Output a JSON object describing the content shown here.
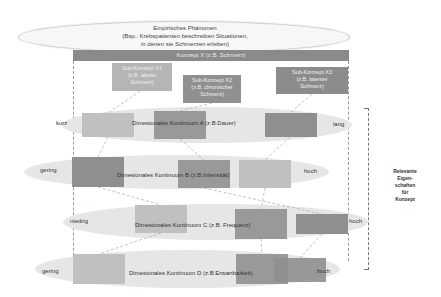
{
  "phenomenon": {
    "title": "Empirisches Phänomen",
    "line2": "(Bsp.: Krebspatienten beschreiben Situationen,",
    "line3": "in denen sie Schmerzen erleben)"
  },
  "concept": {
    "label": "Konzept X (z.B. Schmerz)"
  },
  "sub_concepts": [
    {
      "line1": "Sub-Konzept X1",
      "line2": "(z.B. akuter",
      "line3": "Schmerz)",
      "color": "#b5b5b5"
    },
    {
      "line1": "Sub-Konzept X2",
      "line2": "(z.B. chronischer",
      "line3": "Schmerz)",
      "color": "#909090"
    },
    {
      "line1": "Sub-Konzept X3",
      "line2": "(z.B. latenter",
      "line3": "Schmerz)",
      "color": "#8c8c8c"
    }
  ],
  "continua": [
    {
      "label": "Dimesionales Kontinuum A (z.B.Dauer)",
      "low": "kurz",
      "high": "lang"
    },
    {
      "label": "Dimesionales Kontinuum B (z.B.Intensität)",
      "low": "gering",
      "high": "hoch"
    },
    {
      "label": "Dimesionales Kontinuum C (z.B. Frequenz)",
      "low": "niedrig",
      "high": "hoch"
    },
    {
      "label": "Dimesionales Kontinuum D (z.B.Erwartbarkeit)",
      "low": "gering",
      "high": "hoch"
    }
  ],
  "side_label": {
    "line1": "Relevante",
    "line2": "Eigen-",
    "line3": "schaften",
    "line4": "für",
    "line5": "Konzept"
  },
  "colors": {
    "light": "#b5b5b5",
    "medium": "#909090",
    "dark": "#8c8c8c",
    "ellipse": "#e6e6e6"
  }
}
